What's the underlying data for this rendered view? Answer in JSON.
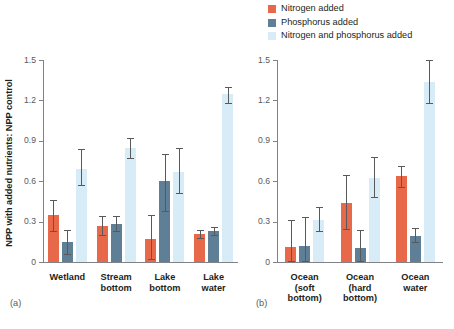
{
  "figure": {
    "ylabel": "NPP with added nutrients: NPP control",
    "panel_a_tag": "(a)",
    "panel_b_tag": "(b)"
  },
  "legend": {
    "position": "top-right",
    "items": [
      {
        "label": "Nitrogen added",
        "color": "#e8684a"
      },
      {
        "label": "Phosphorus added",
        "color": "#5f7f96"
      },
      {
        "label": "Nitrogen and phosphorus added",
        "color": "#d8ecf8"
      }
    ]
  },
  "axis": {
    "ticks": [
      "1.5",
      "1.2",
      "0.9",
      "0.6",
      "0.3",
      "0"
    ],
    "tick_values": [
      1.5,
      1.2,
      0.9,
      0.6,
      0.3,
      0
    ],
    "ymin": 0,
    "ymax": 1.5
  },
  "chart_data": [
    {
      "type": "bar",
      "panel": "(a)",
      "title": "",
      "xlabel": "",
      "ylabel": "NPP with added nutrients: NPP control",
      "ylim": [
        0,
        1.5
      ],
      "yticks": [
        0,
        0.3,
        0.6,
        0.9,
        1.2,
        1.5
      ],
      "grid": false,
      "legend_position": "top-right",
      "categories": [
        "Wetland",
        "Stream bottom",
        "Lake bottom",
        "Lake water"
      ],
      "series": [
        {
          "name": "Nitrogen added",
          "color": "#e8684a",
          "values": [
            0.35,
            0.27,
            0.17,
            0.21
          ],
          "err_low": [
            0.23,
            0.2,
            0.02,
            0.18
          ],
          "err_high": [
            0.46,
            0.34,
            0.35,
            0.24
          ]
        },
        {
          "name": "Phosphorus added",
          "color": "#5f7f96",
          "values": [
            0.15,
            0.285,
            0.6,
            0.23
          ],
          "err_low": [
            0.06,
            0.23,
            0.38,
            0.2
          ],
          "err_high": [
            0.24,
            0.34,
            0.8,
            0.26
          ]
        },
        {
          "name": "Nitrogen and phosphorus added",
          "color": "#d8ecf8",
          "values": [
            0.69,
            0.845,
            0.67,
            1.245
          ],
          "err_low": [
            0.57,
            0.77,
            0.51,
            1.18
          ],
          "err_high": [
            0.84,
            0.92,
            0.845,
            1.3
          ]
        }
      ]
    },
    {
      "type": "bar",
      "panel": "(b)",
      "title": "",
      "xlabel": "",
      "ylabel": "",
      "ylim": [
        0,
        1.5
      ],
      "yticks": [
        0,
        0.3,
        0.6,
        0.9,
        1.2,
        1.5
      ],
      "grid": false,
      "categories": [
        "Ocean (soft bottom)",
        "Ocean (hard bottom)",
        "Ocean water"
      ],
      "series": [
        {
          "name": "Nitrogen added",
          "color": "#e8684a",
          "values": [
            0.115,
            0.435,
            0.635
          ],
          "err_low": [
            0.005,
            0.245,
            0.555
          ],
          "err_high": [
            0.315,
            0.645,
            0.715
          ]
        },
        {
          "name": "Phosphorus added",
          "color": "#5f7f96",
          "values": [
            0.12,
            0.105,
            0.195
          ],
          "err_low": [
            0.005,
            0.005,
            0.145
          ],
          "err_high": [
            0.335,
            0.235,
            0.255
          ]
        },
        {
          "name": "Nitrogen and phosphorus added",
          "color": "#d8ecf8",
          "values": [
            0.315,
            0.625,
            1.335
          ],
          "err_low": [
            0.23,
            0.485,
            1.18
          ],
          "err_high": [
            0.41,
            0.78,
            1.5
          ]
        }
      ]
    }
  ],
  "panel_a": {
    "tag": "(a)",
    "xlabels": [
      {
        "line1": "Wetland",
        "line2": ""
      },
      {
        "line1": "Stream",
        "line2": "bottom"
      },
      {
        "line1": "Lake",
        "line2": "bottom"
      },
      {
        "line1": "Lake",
        "line2": "water"
      }
    ]
  },
  "panel_b": {
    "tag": "(b)",
    "xlabels": [
      {
        "line1": "Ocean",
        "line2": "(soft",
        "line3": "bottom)"
      },
      {
        "line1": "Ocean",
        "line2": "(hard",
        "line3": "bottom)"
      },
      {
        "line1": "Ocean",
        "line2": "water",
        "line3": ""
      }
    ]
  }
}
